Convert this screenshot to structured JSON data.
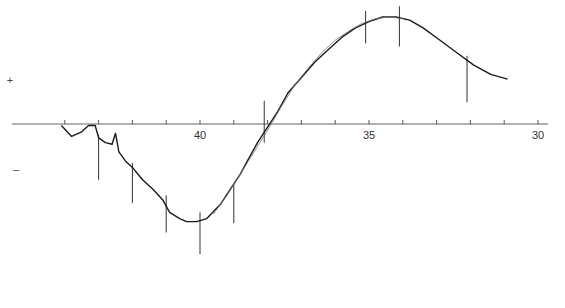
{
  "chart_data": {
    "type": "line",
    "title": "",
    "xlabel": "",
    "ylabel": "",
    "x_axis_reversed": true,
    "xlim": [
      44.5,
      29.5
    ],
    "grid": false,
    "legend": null,
    "tick_labels": [
      {
        "value": 40,
        "label": "40"
      },
      {
        "value": 35,
        "label": "35"
      },
      {
        "value": 30,
        "label": "30"
      }
    ],
    "minor_ticks": [
      44,
      43,
      42,
      41,
      39,
      38,
      37,
      36,
      34,
      33,
      32,
      31
    ],
    "y_markers": {
      "positive": "+",
      "negative": "–"
    },
    "series": [
      {
        "name": "observed trace (thick)",
        "points": [
          [
            44.1,
            -0.1
          ],
          [
            43.8,
            -0.8
          ],
          [
            43.5,
            -0.5
          ],
          [
            43.3,
            -0.1
          ],
          [
            43.1,
            -0.1
          ],
          [
            43.0,
            -0.9
          ],
          [
            42.8,
            -1.2
          ],
          [
            42.6,
            -1.3
          ],
          [
            42.5,
            -0.6
          ],
          [
            42.4,
            -1.8
          ],
          [
            42.2,
            -2.4
          ],
          [
            42.0,
            -2.8
          ],
          [
            41.7,
            -3.6
          ],
          [
            41.4,
            -4.2
          ],
          [
            41.1,
            -4.9
          ],
          [
            40.9,
            -5.7
          ],
          [
            40.6,
            -6.1
          ],
          [
            40.4,
            -6.3
          ],
          [
            40.1,
            -6.3
          ],
          [
            39.8,
            -6.1
          ],
          [
            39.4,
            -5.2
          ],
          [
            39.1,
            -4.2
          ],
          [
            38.8,
            -3.2
          ],
          [
            38.6,
            -2.4
          ],
          [
            38.3,
            -1.2
          ],
          [
            38.0,
            -0.2
          ],
          [
            37.7,
            0.8
          ],
          [
            37.4,
            2.0
          ],
          [
            37.0,
            3.0
          ],
          [
            36.6,
            4.0
          ],
          [
            36.2,
            4.8
          ],
          [
            35.8,
            5.6
          ],
          [
            35.4,
            6.2
          ],
          [
            35.0,
            6.6
          ],
          [
            34.6,
            6.9
          ],
          [
            34.2,
            6.9
          ],
          [
            33.8,
            6.7
          ],
          [
            33.4,
            6.2
          ],
          [
            32.9,
            5.4
          ],
          [
            32.4,
            4.6
          ],
          [
            31.9,
            3.8
          ],
          [
            31.4,
            3.2
          ],
          [
            30.9,
            2.9
          ]
        ]
      },
      {
        "name": "model fit (thin)",
        "points": [
          [
            39.6,
            -5.8
          ],
          [
            39.2,
            -4.6
          ],
          [
            38.8,
            -3.2
          ],
          [
            38.4,
            -1.8
          ],
          [
            38.0,
            -0.4
          ],
          [
            37.6,
            1.1
          ],
          [
            37.2,
            2.5
          ],
          [
            36.8,
            3.6
          ],
          [
            36.4,
            4.6
          ],
          [
            36.0,
            5.4
          ],
          [
            35.6,
            6.0
          ],
          [
            35.2,
            6.5
          ],
          [
            34.8,
            6.8
          ],
          [
            34.4,
            6.9
          ],
          [
            34.0,
            6.8
          ]
        ]
      }
    ],
    "spikes": [
      {
        "x": 43.0,
        "y_from": -0.7,
        "y_to": -3.6
      },
      {
        "x": 42.0,
        "y_from": -2.5,
        "y_to": -5.1
      },
      {
        "x": 41.0,
        "y_from": -4.6,
        "y_to": -7.0
      },
      {
        "x": 40.0,
        "y_from": -5.7,
        "y_to": -8.4
      },
      {
        "x": 39.0,
        "y_from": -3.9,
        "y_to": -6.4
      },
      {
        "x": 38.1,
        "y_from": 1.5,
        "y_to": -1.2
      },
      {
        "x": 35.1,
        "y_from": 7.3,
        "y_to": 5.2
      },
      {
        "x": 34.1,
        "y_from": 7.6,
        "y_to": 5.0
      },
      {
        "x": 32.1,
        "y_from": 4.4,
        "y_to": 1.4
      }
    ]
  }
}
